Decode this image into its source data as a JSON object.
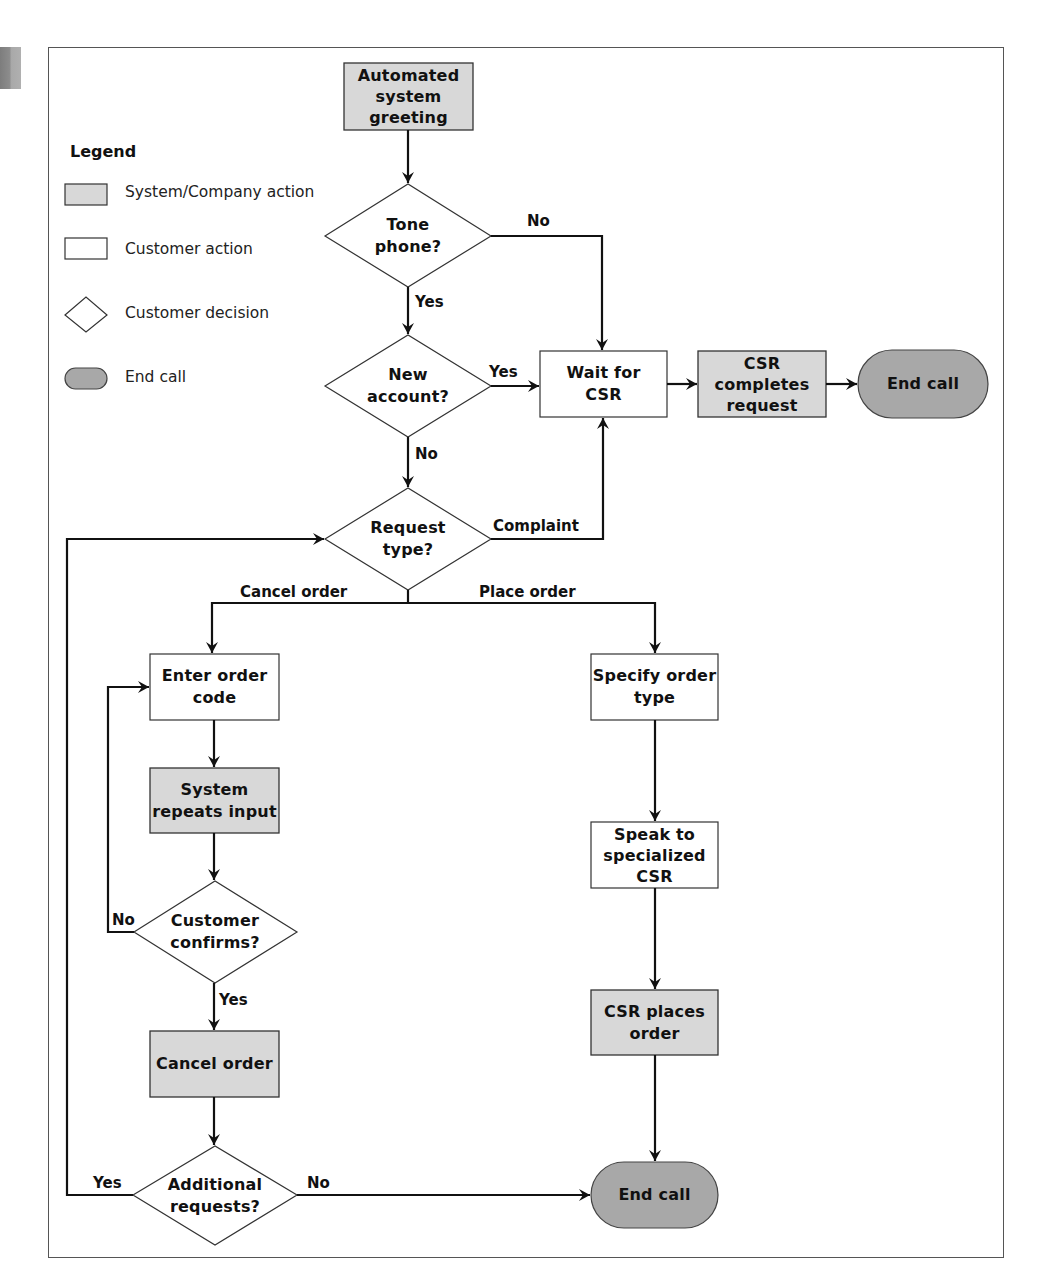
{
  "legend": {
    "title": "Legend",
    "items": [
      {
        "shape": "gray-rectangle",
        "label": "System/Company action"
      },
      {
        "shape": "white-rectangle",
        "label": "Customer action"
      },
      {
        "shape": "diamond",
        "label": "Customer decision"
      },
      {
        "shape": "dark-oval",
        "label": "End call"
      }
    ]
  },
  "colors": {
    "system_action_fill": "#d8d8d8",
    "customer_action_fill": "#ffffff",
    "end_call_fill": "#a8a8a8",
    "stroke": "#111111"
  },
  "nodes": {
    "greeting": {
      "type": "system",
      "label": "Automated\nsystem\ngreeting"
    },
    "tone_phone": {
      "type": "decision",
      "label": "Tone\nphone?"
    },
    "new_account": {
      "type": "decision",
      "label": "New\naccount?"
    },
    "wait_csr": {
      "type": "customer",
      "label": "Wait for\nCSR"
    },
    "csr_completes": {
      "type": "system",
      "label": "CSR\ncompletes\nrequest"
    },
    "end_call_top": {
      "type": "end",
      "label": "End call"
    },
    "request_type": {
      "type": "decision",
      "label": "Request\ntype?"
    },
    "enter_order_code": {
      "type": "customer",
      "label": "Enter order\ncode"
    },
    "system_repeats": {
      "type": "system",
      "label": "System\nrepeats input"
    },
    "customer_confirms": {
      "type": "decision",
      "label": "Customer\nconfirms?"
    },
    "cancel_order": {
      "type": "system",
      "label": "Cancel order"
    },
    "additional_requests": {
      "type": "decision",
      "label": "Additional\nrequests?"
    },
    "specify_order_type": {
      "type": "customer",
      "label": "Specify order\ntype"
    },
    "speak_specialized": {
      "type": "customer",
      "label": "Speak to\nspecialized\nCSR"
    },
    "csr_places_order": {
      "type": "system",
      "label": "CSR places\norder"
    },
    "end_call_bottom": {
      "type": "end",
      "label": "End call"
    }
  },
  "edge_labels": {
    "tone_no": "No",
    "tone_yes": "Yes",
    "new_yes": "Yes",
    "new_no": "No",
    "complaint": "Complaint",
    "cancel_order": "Cancel order",
    "place_order": "Place order",
    "confirm_no": "No",
    "confirm_yes": "Yes",
    "additional_yes": "Yes",
    "additional_no": "No"
  }
}
